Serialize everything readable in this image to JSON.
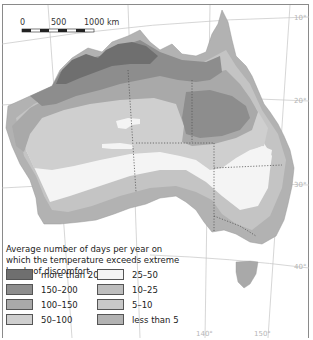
{
  "scale_bar": {
    "labels": [
      "0",
      "500",
      "1000 km"
    ]
  },
  "latitude_labels": [
    "10°",
    "20°",
    "30°",
    "40°"
  ],
  "longitude_labels": [
    "140°",
    "150°"
  ],
  "legend": {
    "title": "Average number of days per year on which the temperature exceeds extreme levels of discomfort",
    "items": [
      {
        "label": "more than 200",
        "color": "#6f6f6f"
      },
      {
        "label": "150–200",
        "color": "#8d8d8d"
      },
      {
        "label": "100–150",
        "color": "#a9a9a9"
      },
      {
        "label": "50–100",
        "color": "#cfcfcf"
      },
      {
        "label": "25–50",
        "color": "#f4f4f4"
      },
      {
        "label": "10–25",
        "color": "#bdbdbd"
      },
      {
        "label": "5–10",
        "color": "#c8c8c8"
      },
      {
        "label": "less than 5",
        "color": "#b2b2b2"
      }
    ]
  }
}
